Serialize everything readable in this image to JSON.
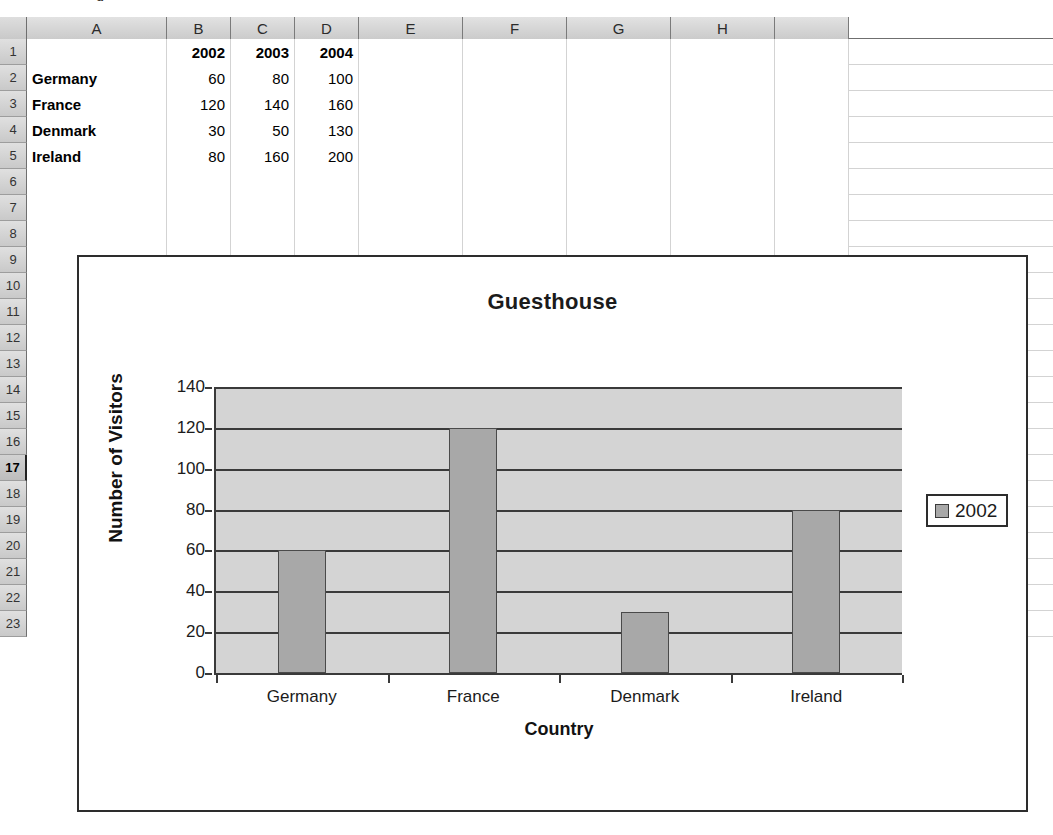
{
  "app": {
    "type": "spreadsheet",
    "clipped_top_text": "g"
  },
  "sheet": {
    "column_headers": [
      "A",
      "B",
      "C",
      "D",
      "E",
      "F",
      "G",
      "H",
      ""
    ],
    "column_widths": [
      140,
      64,
      64,
      64,
      104,
      104,
      104,
      104,
      74
    ],
    "row_numbers": [
      "1",
      "2",
      "3",
      "4",
      "5",
      "6",
      "7",
      "8",
      "9",
      "10",
      "11",
      "12",
      "13",
      "14",
      "15",
      "16",
      "17",
      "18",
      "19",
      "20",
      "21",
      "22",
      "23"
    ],
    "active_row": "17",
    "rows": [
      {
        "num": "1",
        "cells": [
          {
            "v": "",
            "align": "txt"
          },
          {
            "v": "2002",
            "align": "hdr"
          },
          {
            "v": "2003",
            "align": "hdr"
          },
          {
            "v": "2004",
            "align": "hdr"
          },
          {
            "v": "",
            "align": "num"
          },
          {
            "v": "",
            "align": "num"
          },
          {
            "v": "",
            "align": "num"
          },
          {
            "v": "",
            "align": "num"
          },
          {
            "v": "",
            "align": "num"
          }
        ]
      },
      {
        "num": "2",
        "cells": [
          {
            "v": "Germany",
            "align": "txt"
          },
          {
            "v": "60",
            "align": "num"
          },
          {
            "v": "80",
            "align": "num"
          },
          {
            "v": "100",
            "align": "num"
          },
          {
            "v": "",
            "align": "num"
          },
          {
            "v": "",
            "align": "num"
          },
          {
            "v": "",
            "align": "num"
          },
          {
            "v": "",
            "align": "num"
          },
          {
            "v": "",
            "align": "num"
          }
        ]
      },
      {
        "num": "3",
        "cells": [
          {
            "v": "France",
            "align": "txt"
          },
          {
            "v": "120",
            "align": "num"
          },
          {
            "v": "140",
            "align": "num"
          },
          {
            "v": "160",
            "align": "num"
          },
          {
            "v": "",
            "align": "num"
          },
          {
            "v": "",
            "align": "num"
          },
          {
            "v": "",
            "align": "num"
          },
          {
            "v": "",
            "align": "num"
          },
          {
            "v": "",
            "align": "num"
          }
        ]
      },
      {
        "num": "4",
        "cells": [
          {
            "v": "Denmark",
            "align": "txt"
          },
          {
            "v": "30",
            "align": "num"
          },
          {
            "v": "50",
            "align": "num"
          },
          {
            "v": "130",
            "align": "num"
          },
          {
            "v": "",
            "align": "num"
          },
          {
            "v": "",
            "align": "num"
          },
          {
            "v": "",
            "align": "num"
          },
          {
            "v": "",
            "align": "num"
          },
          {
            "v": "",
            "align": "num"
          }
        ]
      },
      {
        "num": "5",
        "cells": [
          {
            "v": "Ireland",
            "align": "txt"
          },
          {
            "v": "80",
            "align": "num"
          },
          {
            "v": "160",
            "align": "num"
          },
          {
            "v": "200",
            "align": "num"
          },
          {
            "v": "",
            "align": "num"
          },
          {
            "v": "",
            "align": "num"
          },
          {
            "v": "",
            "align": "num"
          },
          {
            "v": "",
            "align": "num"
          },
          {
            "v": "",
            "align": "num"
          }
        ]
      }
    ]
  },
  "chart_data": {
    "type": "bar",
    "title": "Guesthouse",
    "xlabel": "Country",
    "ylabel": "Number of Visitors",
    "categories": [
      "Germany",
      "France",
      "Denmark",
      "Ireland"
    ],
    "series": [
      {
        "name": "2002",
        "values": [
          60,
          120,
          30,
          80
        ],
        "color": "#a8a8a8"
      }
    ],
    "ylim": [
      0,
      140
    ],
    "yticks": [
      0,
      20,
      40,
      60,
      80,
      100,
      120,
      140
    ],
    "grid": true,
    "legend_position": "right",
    "plot_background": "#d4d4d4"
  }
}
